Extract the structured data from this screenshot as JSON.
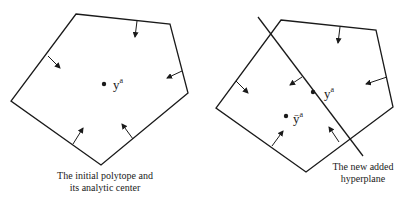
{
  "left_panel": {
    "center_label": {
      "base": "y",
      "sup": "a"
    },
    "caption": [
      "The initial polytope and",
      "its analytic center"
    ]
  },
  "right_panel": {
    "center_label": {
      "base": "y",
      "sup": "a"
    },
    "new_center_label": {
      "base": "ȳ",
      "sup": "a"
    },
    "caption": [
      "The new added",
      "hyperplane"
    ]
  },
  "colors": {
    "stroke": "#1a1a1a",
    "background": "#ffffff"
  }
}
